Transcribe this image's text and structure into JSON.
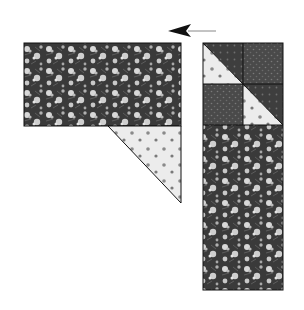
{
  "diagram": {
    "colors": {
      "background": "#ffffff",
      "dark_floral": "#3a3a3a",
      "dark_floral_flower": "#d8d8d8",
      "light_print": "#ececec",
      "light_print_dot": "#7a7a7a",
      "medium_dark_print": "#4a4a4a",
      "outline": "#111111",
      "arrow": "#111111"
    },
    "arrow": {
      "direction": "left",
      "label": ""
    },
    "left_unit": {
      "rectangle": {
        "fabric": "dark floral",
        "x": 24,
        "y": 43,
        "w": 157,
        "h": 83
      },
      "triangle": {
        "fabric": "light print",
        "points": "108,126 181,126 181,203"
      }
    },
    "right_unit": {
      "x": 203,
      "y": 43,
      "w": 80,
      "h": 247,
      "blocks": [
        {
          "name": "half-square-triangle-top-left",
          "fabric": "light/dark"
        },
        {
          "name": "square-top-right",
          "fabric": "medium dark print"
        },
        {
          "name": "square-middle-left",
          "fabric": "medium dark print"
        },
        {
          "name": "half-square-triangle-middle-right",
          "fabric": "dark/light"
        }
      ],
      "floral_strip": {
        "fabric": "dark floral",
        "y": 125,
        "h": 165
      }
    }
  }
}
